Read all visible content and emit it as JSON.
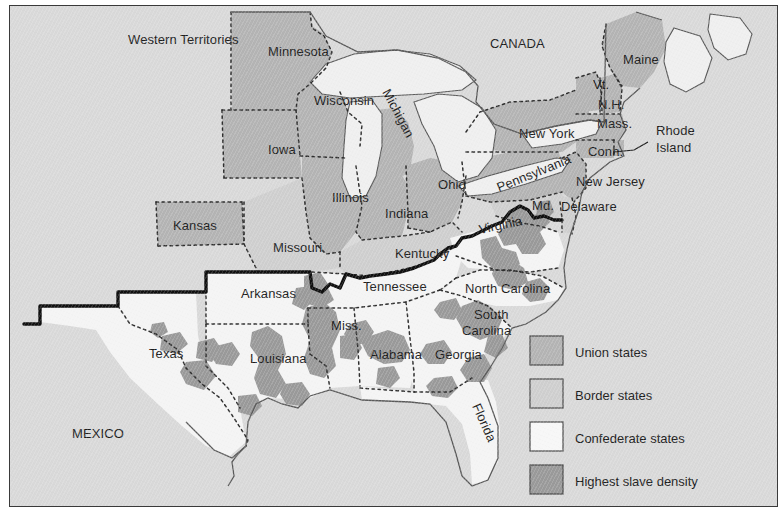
{
  "map": {
    "title": "Civil War states map",
    "background_label": "ocean-and-territory-background",
    "colors": {
      "background": "#d9d9d9",
      "union": "#b4b4b4",
      "border_state": "#cfcfcf",
      "confederate": "#f4f4f4",
      "slave_density": "#9a9a9a",
      "water": "#efefef",
      "outline": "#4a4a4a",
      "state_dash": "#333333",
      "confederacy_line": "#111111",
      "frame": "#3a3a3a",
      "text": "#1d1d1d"
    },
    "regions": [
      {
        "id": "western-territories",
        "label": "Western Territories",
        "class": "background",
        "x": 118,
        "y": 38,
        "rotate": 0,
        "size": 14
      },
      {
        "id": "canada",
        "label": "CANADA",
        "class": "background",
        "x": 480,
        "y": 42,
        "rotate": 0,
        "size": 13.5
      },
      {
        "id": "mexico",
        "label": "MEXICO",
        "class": "background",
        "x": 62,
        "y": 432,
        "rotate": 0,
        "size": 13.5
      },
      {
        "id": "minnesota",
        "label": "Minnesota",
        "class": "union",
        "x": 258,
        "y": 50,
        "rotate": 0,
        "size": 13
      },
      {
        "id": "wisconsin",
        "label": "Wisconsin",
        "class": "union",
        "x": 304,
        "y": 99,
        "rotate": 0,
        "size": 13
      },
      {
        "id": "michigan",
        "label": "Michigan",
        "class": "union",
        "x": 372,
        "y": 86,
        "rotate": 62,
        "size": 13
      },
      {
        "id": "iowa",
        "label": "Iowa",
        "class": "union",
        "x": 258,
        "y": 148,
        "rotate": 0,
        "size": 13
      },
      {
        "id": "illinois",
        "label": "Illinois",
        "class": "union",
        "x": 322,
        "y": 196,
        "rotate": 0,
        "size": 13
      },
      {
        "id": "indiana",
        "label": "Indiana",
        "class": "union",
        "x": 375,
        "y": 212,
        "rotate": 0,
        "size": 13
      },
      {
        "id": "ohio",
        "label": "Ohio",
        "class": "union",
        "x": 428,
        "y": 183,
        "rotate": 0,
        "size": 13
      },
      {
        "id": "kansas",
        "label": "Kansas",
        "class": "union",
        "x": 163,
        "y": 224,
        "rotate": 0,
        "size": 13
      },
      {
        "id": "new-york",
        "label": "New York",
        "class": "union",
        "x": 509,
        "y": 132,
        "rotate": 0,
        "size": 13
      },
      {
        "id": "pennsylvania",
        "label": "Pennsylvania",
        "class": "union",
        "x": 489,
        "y": 186,
        "rotate": -22,
        "size": 13
      },
      {
        "id": "new-jersey",
        "label": "New Jersey",
        "class": "union",
        "x": 566,
        "y": 180,
        "rotate": 0,
        "size": 13
      },
      {
        "id": "maine",
        "label": "Maine",
        "class": "union",
        "x": 613,
        "y": 58,
        "rotate": 0,
        "size": 13
      },
      {
        "id": "vermont",
        "label": "Vt.",
        "class": "union",
        "x": 583,
        "y": 83,
        "rotate": 0,
        "size": 11
      },
      {
        "id": "new-hampshire",
        "label": "N.H.",
        "class": "union",
        "x": 588,
        "y": 103,
        "rotate": 0,
        "size": 11
      },
      {
        "id": "massachusetts",
        "label": "Mass.",
        "class": "union",
        "x": 587,
        "y": 122,
        "rotate": 0,
        "size": 11
      },
      {
        "id": "connecticut",
        "label": "Conn.",
        "class": "union",
        "x": 578,
        "y": 150,
        "rotate": 0,
        "size": 11
      },
      {
        "id": "rhode-island",
        "label": "Rhode",
        "class": "union",
        "x": 646,
        "y": 129,
        "rotate": 0,
        "size": 13
      },
      {
        "id": "rhode-island-2",
        "label": "Island",
        "class": "union",
        "x": 646,
        "y": 146,
        "rotate": 0,
        "size": 13
      },
      {
        "id": "delaware",
        "label": "Delaware",
        "class": "border",
        "x": 551,
        "y": 205,
        "rotate": 0,
        "size": 13
      },
      {
        "id": "maryland",
        "label": "Md.",
        "class": "border",
        "x": 522,
        "y": 204,
        "rotate": 0,
        "size": 12
      },
      {
        "id": "missouri",
        "label": "Missouri",
        "class": "border",
        "x": 263,
        "y": 246,
        "rotate": 0,
        "size": 13
      },
      {
        "id": "kentucky",
        "label": "Kentucky",
        "class": "border",
        "x": 385,
        "y": 252,
        "rotate": 0,
        "size": 13
      },
      {
        "id": "virginia",
        "label": "Virginia",
        "class": "confederate",
        "x": 470,
        "y": 228,
        "rotate": -12,
        "size": 13
      },
      {
        "id": "arkansas",
        "label": "Arkansas",
        "class": "confederate",
        "x": 231,
        "y": 292,
        "rotate": 0,
        "size": 13
      },
      {
        "id": "tennessee",
        "label": "Tennessee",
        "class": "confederate",
        "x": 353,
        "y": 285,
        "rotate": 0,
        "size": 13
      },
      {
        "id": "north-carolina",
        "label": "North Carolina",
        "class": "confederate",
        "x": 455,
        "y": 287,
        "rotate": 0,
        "size": 13
      },
      {
        "id": "south-carolina",
        "label": "South",
        "class": "confederate",
        "x": 464,
        "y": 313,
        "rotate": 0,
        "size": 13
      },
      {
        "id": "south-carolina-2",
        "label": "Carolina",
        "class": "confederate",
        "x": 452,
        "y": 329,
        "rotate": 0,
        "size": 13
      },
      {
        "id": "mississippi",
        "label": "Miss.",
        "class": "confederate",
        "x": 321,
        "y": 324,
        "rotate": 0,
        "size": 13
      },
      {
        "id": "louisiana",
        "label": "Louisiana",
        "class": "confederate",
        "x": 240,
        "y": 357,
        "rotate": 0,
        "size": 13
      },
      {
        "id": "alabama",
        "label": "Alabama",
        "class": "confederate",
        "x": 360,
        "y": 353,
        "rotate": 0,
        "size": 13
      },
      {
        "id": "georgia",
        "label": "Georgia",
        "class": "confederate",
        "x": 425,
        "y": 353,
        "rotate": 0,
        "size": 13
      },
      {
        "id": "florida",
        "label": "Florida",
        "class": "confederate",
        "x": 462,
        "y": 400,
        "rotate": 66,
        "size": 13
      },
      {
        "id": "texas",
        "label": "Texas",
        "class": "confederate",
        "x": 139,
        "y": 352,
        "rotate": 0,
        "size": 13
      }
    ]
  },
  "legend": {
    "name": "map-legend",
    "items": [
      {
        "id": "union-states",
        "label": "Union states",
        "swatch": "#b4b4b4"
      },
      {
        "id": "border-states",
        "label": "Border states",
        "swatch": "#cfcfcf"
      },
      {
        "id": "confederate-states",
        "label": "Confederate states",
        "swatch": "#f7f7f7"
      },
      {
        "id": "highest-slave-density",
        "label": "Highest slave density",
        "swatch": "#9a9a9a"
      }
    ]
  }
}
